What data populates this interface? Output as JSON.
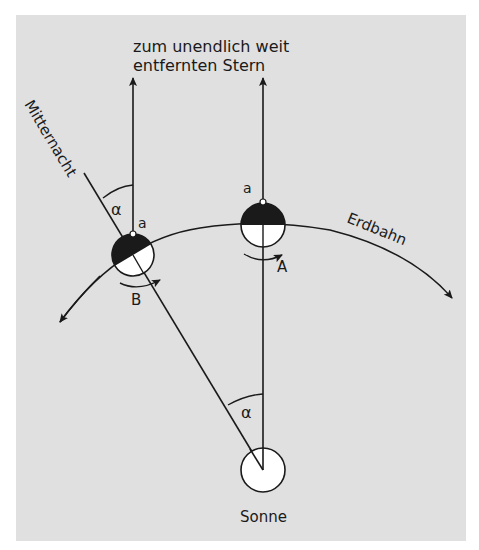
{
  "diagram": {
    "title_lines": [
      "zum unendlich weit",
      "entfernten Stern"
    ],
    "labels": {
      "midnight": "Mitternacht",
      "orbit": "Erdbahn",
      "sun": "Sonne",
      "position_a": "A",
      "position_b": "B",
      "angle_top": "α",
      "angle_bottom": "α",
      "observer_a": "a",
      "observer_b": "a"
    },
    "colors": {
      "background": "#e0e0e0",
      "ink": "#1a1a1a",
      "fill_light": "#ffffff"
    }
  }
}
